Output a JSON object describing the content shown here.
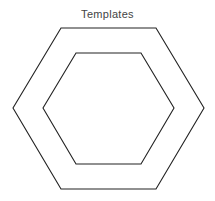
{
  "diagram": {
    "title": "Templates",
    "shapes": [
      {
        "name": "outer-hexagon",
        "type": "hexagon",
        "stroke": "#222222",
        "fill": "none"
      },
      {
        "name": "inner-hexagon",
        "type": "hexagon",
        "stroke": "#222222",
        "fill": "none"
      }
    ]
  }
}
